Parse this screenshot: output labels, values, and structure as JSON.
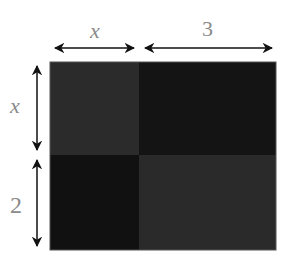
{
  "diagram": {
    "type": "area-model-rectangle",
    "top_labels": [
      {
        "text": "x",
        "italic": true
      },
      {
        "text": "3",
        "italic": false
      }
    ],
    "left_labels": [
      {
        "text": "x",
        "italic": true
      },
      {
        "text": "2",
        "italic": false
      }
    ],
    "cells": [
      {
        "row": 0,
        "col": 0,
        "color": "#2b2b2b"
      },
      {
        "row": 0,
        "col": 1,
        "color": "#141414"
      },
      {
        "row": 1,
        "col": 0,
        "color": "#111111"
      },
      {
        "row": 1,
        "col": 1,
        "color": "#2a2a2a"
      }
    ],
    "colors": {
      "arrow": "#111111",
      "label": "#8a8a8a",
      "border": "#555555"
    }
  }
}
